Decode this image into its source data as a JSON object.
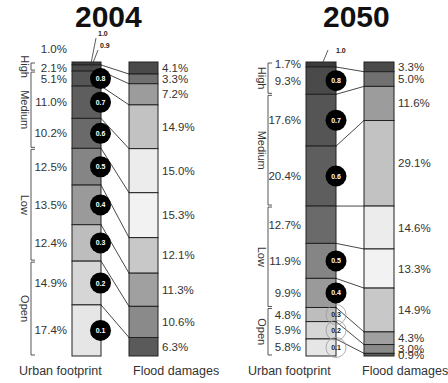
{
  "chart_data": [
    {
      "type": "table",
      "title": "2004",
      "xlabel_left": "Urban footprint",
      "xlabel_right": "Flood damages",
      "categories": [
        "High",
        "Medium",
        "Low",
        "Open"
      ],
      "deciles": [
        "1.0",
        "0.9",
        "0.8",
        "0.7",
        "0.6",
        "0.5",
        "0.4",
        "0.3",
        "0.2",
        "0.1"
      ],
      "urban_footprint_pct": [
        1.0,
        2.1,
        5.1,
        11.0,
        10.2,
        12.5,
        13.5,
        12.4,
        14.9,
        17.4
      ],
      "flood_damages_pct": [
        4.1,
        3.3,
        7.2,
        14.9,
        15.0,
        15.3,
        12.1,
        11.3,
        10.6,
        6.3
      ],
      "groups": [
        {
          "name": "High",
          "from": 0,
          "to": 2
        },
        {
          "name": "Medium",
          "from": 2,
          "to": 5
        },
        {
          "name": "Low",
          "from": 5,
          "to": 8
        },
        {
          "name": "Open",
          "from": 8,
          "to": 10
        }
      ]
    },
    {
      "type": "table",
      "title": "2050",
      "xlabel_left": "Urban footprint",
      "xlabel_right": "Flood damages",
      "categories": [
        "High",
        "Medium",
        "Low",
        "Open"
      ],
      "deciles": [
        "1.0",
        "0.8",
        "0.7",
        "0.6",
        "0.5",
        "0.4",
        "0.3",
        "0.2",
        "0.1"
      ],
      "urban_footprint_pct": [
        1.7,
        9.3,
        17.6,
        20.4,
        12.7,
        11.9,
        9.9,
        4.8,
        5.9,
        5.8
      ],
      "flood_damages_pct": [
        3.3,
        5.0,
        11.6,
        29.1,
        14.6,
        13.3,
        14.9,
        4.3,
        3.0,
        0.9
      ],
      "groups": [
        {
          "name": "High",
          "from": 0,
          "to": 2
        },
        {
          "name": "Medium",
          "from": 2,
          "to": 4
        },
        {
          "name": "Low",
          "from": 4,
          "to": 7
        },
        {
          "name": "Open",
          "from": 7,
          "to": 10
        }
      ]
    }
  ],
  "panels": {
    "left": {
      "title": "2004",
      "xlabel_left": "Urban footprint",
      "xlabel_right": "Flood damages"
    },
    "right": {
      "title": "2050",
      "xlabel_left": "Urban footprint",
      "xlabel_right": "Flood damages"
    }
  },
  "colors": {
    "shades": [
      "#3c3c3c",
      "#4a4a4a",
      "#555555",
      "#5e5e5e",
      "#6a6a6a",
      "#858585",
      "#9a9a9a",
      "#bdbdbd",
      "#d6d6d6",
      "#e6e6e6"
    ],
    "flood_shades": [
      "#4a4a4a",
      "#707070",
      "#9c9c9c",
      "#c2c2c2",
      "#ececec",
      "#f2f2f2",
      "#c8c8c8",
      "#a0a0a0",
      "#8a8a8a",
      "#5a5a5a"
    ],
    "badge": "#000000",
    "outline": "#222222"
  }
}
